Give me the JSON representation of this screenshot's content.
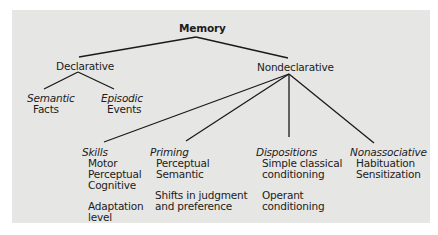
{
  "diagram": {
    "root": "Memory",
    "branches": [
      {
        "label": "Declarative",
        "children": [
          {
            "category": "Semantic",
            "items": [
              "Facts"
            ]
          },
          {
            "category": "Episodic",
            "items": [
              "Events"
            ]
          }
        ]
      },
      {
        "label": "Nondeclarative",
        "children": [
          {
            "category": "Skills",
            "items": [
              "Motor",
              "Perceptual",
              "Cognitive"
            ],
            "extra": [
              "Adaptation",
              "level"
            ]
          },
          {
            "category": "Priming",
            "items": [
              "Perceptual",
              "Semantic"
            ],
            "extra": [
              "Shifts in judgment",
              "and preference"
            ]
          },
          {
            "category": "Dispositions",
            "items": [
              "Simple classical",
              "conditioning"
            ],
            "extra": [
              "Operant",
              "conditioning"
            ]
          },
          {
            "category": "Nonassociative",
            "items": [
              "Habituation",
              "Sensitization"
            ]
          }
        ]
      }
    ]
  },
  "colors": {
    "panel": "#e6e6e4",
    "line": "#1a1a1a",
    "text": "#1c1c1c"
  }
}
